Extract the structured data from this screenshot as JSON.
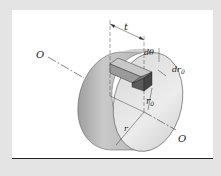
{
  "figure": {
    "labels": {
      "axis_left": "O",
      "axis_right": "O",
      "thickness": "t",
      "dtheta": "dθ",
      "dr0": "dr",
      "dr0_sub": "0",
      "r0": "r",
      "r0_sub": "0",
      "radius": "r"
    },
    "colors": {
      "background": "#e4e4e4",
      "card": "#ffffff",
      "disk_light": "#e2e2e2",
      "disk_dark": "#a8a8a8",
      "element_dark": "#5a5a5a",
      "element_light": "#b8b8b8",
      "line": "#333333"
    }
  }
}
